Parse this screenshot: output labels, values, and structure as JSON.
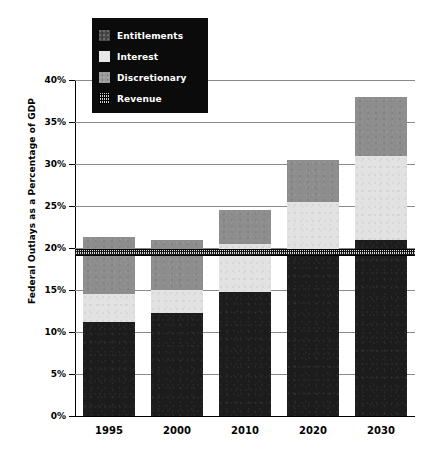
{
  "chart_data": {
    "type": "bar",
    "subtype": "stacked-bar-with-reference-line",
    "title": "",
    "xlabel": "",
    "ylabel": "Federal Outlays as a Percentage of GDP",
    "categories": [
      "1995",
      "2000",
      "2010",
      "2020",
      "2030"
    ],
    "ylim": [
      0,
      40
    ],
    "ytick_step": 5,
    "ytick_labels": [
      "0%",
      "5%",
      "10%",
      "15%",
      "20%",
      "25%",
      "30%",
      "35%",
      "40%"
    ],
    "ytick_values": [
      0,
      5,
      10,
      15,
      20,
      25,
      30,
      35,
      40
    ],
    "grid": true,
    "grid_axis": "y",
    "legend_position": "top-left",
    "series": [
      {
        "name": "Entitlements",
        "swatch": "dark-gray-textured",
        "color": "#1c1c1c",
        "values": [
          11.2,
          12.3,
          14.8,
          19.0,
          20.9
        ]
      },
      {
        "name": "Interest",
        "swatch": "light-gray",
        "color": "#e2e2e2",
        "values": [
          3.3,
          2.7,
          5.7,
          6.5,
          10.1
        ]
      },
      {
        "name": "Discretionary",
        "swatch": "medium-gray-textured",
        "color": "#8d8d8d",
        "values": [
          6.8,
          6.0,
          4.0,
          5.0,
          7.0
        ]
      }
    ],
    "totals": [
      21.3,
      21.0,
      24.5,
      30.5,
      38.0
    ],
    "reference_line": {
      "name": "Revenue",
      "swatch": "hatched",
      "value": 19.5,
      "style": "hatched-band"
    },
    "legend": [
      {
        "label": "Entitlements",
        "swatch": "dark-gray-textured"
      },
      {
        "label": "Interest",
        "swatch": "light-gray"
      },
      {
        "label": "Discretionary",
        "swatch": "medium-gray-textured"
      },
      {
        "label": "Revenue",
        "swatch": "hatched"
      }
    ],
    "colors": {
      "entitlements": "#1c1c1c",
      "interest": "#e2e2e2",
      "discretionary": "#8d8d8d",
      "revenue": "#d9d9d9",
      "legend_background": "#0b0b0b",
      "legend_text": "#ffffff",
      "grid": "#8a8a8a",
      "axis": "#000000",
      "page_background": "#ffffff"
    }
  }
}
